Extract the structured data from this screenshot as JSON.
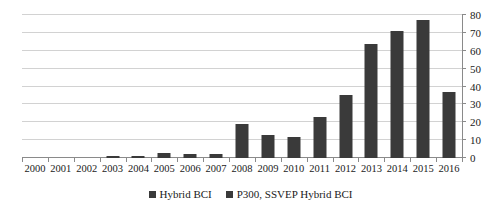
{
  "chart_data": {
    "type": "bar",
    "title": "",
    "subtitle": "",
    "xlabel": "",
    "ylabel": "",
    "ylim": [
      0,
      80
    ],
    "ytick_step": 10,
    "yticks": [
      0,
      10,
      20,
      30,
      40,
      50,
      60,
      70,
      80
    ],
    "grid": "horizontal",
    "y_axis_position": "right",
    "legend_position": "bottom-center",
    "categories": [
      "2000",
      "2001",
      "2002",
      "2003",
      "2004",
      "2005",
      "2006",
      "2007",
      "2008",
      "2009",
      "2010",
      "2011",
      "2012",
      "2013",
      "2014",
      "2015",
      "2016"
    ],
    "series": [
      {
        "name": "Hybrid BCI",
        "color": "#3a3a3a",
        "values": [
          0,
          0,
          0,
          1,
          1,
          3,
          2,
          2,
          19,
          13,
          12,
          23,
          35,
          64,
          71,
          77,
          37
        ]
      },
      {
        "name": "P300, SSVEP Hybrid BCI",
        "color": "#3a3a3a",
        "values": [
          0,
          0,
          0,
          0,
          0,
          0,
          0,
          0,
          0,
          0,
          0,
          0,
          0,
          0,
          0,
          0,
          0
        ]
      }
    ],
    "annotations": []
  },
  "legend": {
    "entries": [
      {
        "label": "Hybrid BCI",
        "color": "#3a3a3a"
      },
      {
        "label": "P300, SSVEP Hybrid BCI",
        "color": "#3a3a3a"
      }
    ]
  },
  "colors": {
    "bar": "#3a3a3a",
    "gridline": "#d2d2d2",
    "axis": "#8a8a8a",
    "background": "#ffffff",
    "text": "#1a1a1a"
  }
}
